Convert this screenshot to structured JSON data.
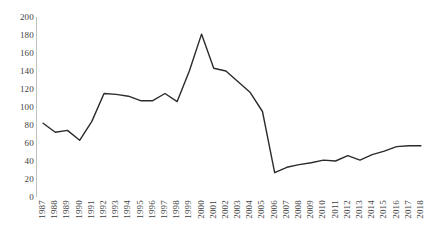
{
  "chart_data": {
    "type": "line",
    "title": "",
    "xlabel": "",
    "ylabel": "",
    "ylim": [
      0,
      200
    ],
    "yticks": [
      0,
      20,
      40,
      60,
      80,
      100,
      120,
      140,
      160,
      180,
      200
    ],
    "grid": false,
    "legend": "none",
    "line_color": "#2b2b2b",
    "categories": [
      "1987",
      "1988",
      "1989",
      "1990",
      "1991",
      "1992",
      "1993",
      "1994",
      "1995",
      "1996",
      "1997",
      "1998",
      "1999",
      "2000",
      "2001",
      "2002",
      "2003",
      "2004",
      "2005",
      "2006",
      "2007",
      "2008",
      "2009",
      "2010",
      "2011",
      "2012",
      "2013",
      "2014",
      "2015",
      "2016",
      "2017",
      "2018"
    ],
    "values": [
      82,
      72,
      74,
      63,
      84,
      115,
      114,
      112,
      107,
      107,
      115,
      106,
      140,
      181,
      143,
      140,
      128,
      116,
      95,
      27,
      33,
      36,
      38,
      41,
      40,
      46,
      41,
      47,
      51,
      56,
      57,
      57
    ],
    "series": [
      {
        "name": "series-1",
        "values": [
          82,
          72,
          74,
          63,
          84,
          115,
          114,
          112,
          107,
          107,
          115,
          106,
          140,
          181,
          143,
          140,
          128,
          116,
          95,
          27,
          33,
          36,
          38,
          41,
          40,
          46,
          41,
          47,
          51,
          56,
          57,
          57
        ]
      }
    ]
  },
  "axes": {
    "y_tick_labels": [
      "200",
      "180",
      "160",
      "140",
      "120",
      "100",
      "80",
      "60",
      "40",
      "20",
      "0"
    ],
    "x_tick_labels": [
      "1987",
      "1988",
      "1989",
      "1990",
      "1991",
      "1992",
      "1993",
      "1994",
      "1995",
      "1996",
      "1997",
      "1998",
      "1999",
      "2000",
      "2001",
      "2002",
      "2003",
      "2004",
      "2005",
      "2006",
      "2007",
      "2008",
      "2009",
      "2010",
      "2011",
      "2012",
      "2013",
      "2014",
      "2015",
      "2016",
      "2017",
      "2018"
    ]
  }
}
